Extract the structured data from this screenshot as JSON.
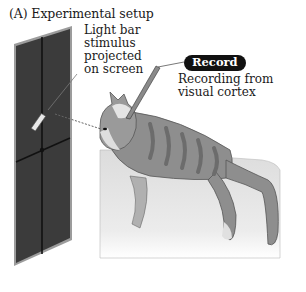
{
  "figure": {
    "title": "(A) Experimental setup",
    "stimulus_label": [
      "Light bar",
      "stimulus",
      "projected",
      "on screen"
    ],
    "record_badge": "Record",
    "recording_label": [
      "Recording from",
      "visual cortex"
    ]
  },
  "colors": {
    "screen": "#3a3a3a",
    "screen_edge": "#9a9a9a",
    "cat_body": "#8c8c8c",
    "cat_light": "#cfcfcf",
    "table": "#e6e6e6",
    "badge_bg": "#111111",
    "badge_text": "#ffffff"
  }
}
